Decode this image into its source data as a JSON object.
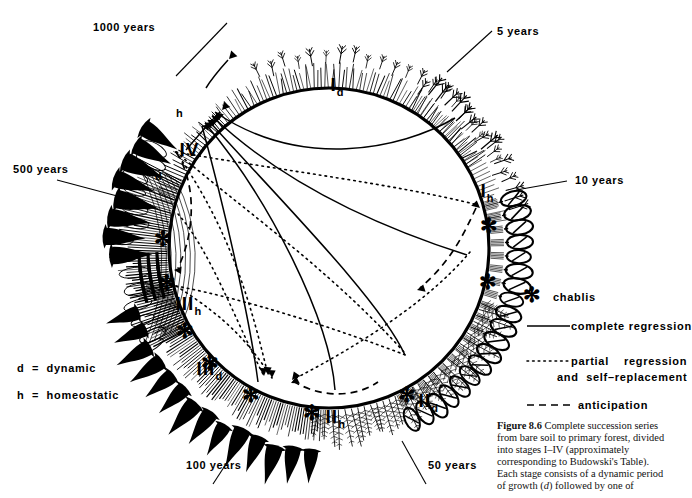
{
  "figure": {
    "type": "circular-succession-diagram",
    "caption_label": "Figure 8.6",
    "caption_text": "Complete succession series from bare soil to primary forest, divided into stages I–IV (approximately corresponding to Budowski's Table). Each stage consists of a dynamic period of growth (d) followed by one of",
    "caption_italic_token": "d"
  },
  "time_labels": [
    {
      "id": "t1000",
      "text": "1000 years"
    },
    {
      "id": "t5",
      "text": "5 years"
    },
    {
      "id": "t500",
      "text": "500 years"
    },
    {
      "id": "t10",
      "text": "10 years"
    },
    {
      "id": "t100",
      "text": "100 years"
    },
    {
      "id": "t50",
      "text": "50 years"
    }
  ],
  "stage_labels": [
    {
      "id": "Id",
      "roman": "I",
      "sub": "d"
    },
    {
      "id": "Ih",
      "roman": "I",
      "sub": "h"
    },
    {
      "id": "IId",
      "roman": "II",
      "sub": "d"
    },
    {
      "id": "IIh",
      "roman": "II",
      "sub": "h"
    },
    {
      "id": "IIId",
      "roman": "III",
      "sub": "d"
    },
    {
      "id": "IIIh",
      "roman": "III",
      "sub": "h"
    },
    {
      "id": "IV",
      "roman": "IV",
      "sub": ""
    }
  ],
  "phase_marks": [
    {
      "id": "h-mark",
      "text": "h"
    },
    {
      "id": "d-mark",
      "text": "d"
    }
  ],
  "key": {
    "dynamic": "d  =  dynamic",
    "homeostatic": "h  =  homeostatic"
  },
  "legend": {
    "chablis": {
      "symbol": "✻",
      "label": "chablis"
    },
    "complete": {
      "style": "solid",
      "label": "complete regression"
    },
    "partial": {
      "style": "dotted",
      "label_line1": "partial    regression",
      "label_line2": "and  self–replacement"
    },
    "anticipation": {
      "style": "dashed",
      "label": "anticipation"
    }
  },
  "colors": {
    "ink": "#000000",
    "paper": "#ffffff",
    "caption": "#111111"
  }
}
